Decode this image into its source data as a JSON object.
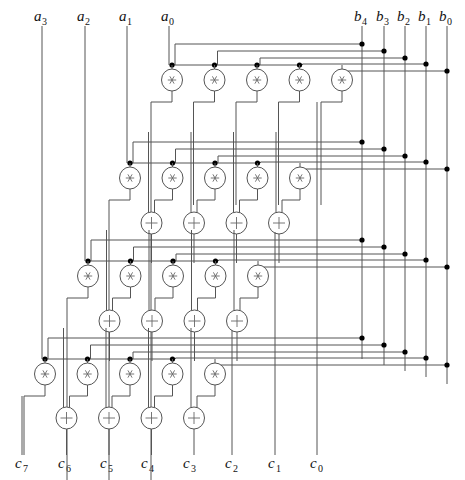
{
  "diagram": {
    "inputs_a": [
      {
        "name": "a",
        "sub": "3",
        "x": 42
      },
      {
        "name": "a",
        "sub": "2",
        "x": 85
      },
      {
        "name": "a",
        "sub": "1",
        "x": 127
      },
      {
        "name": "a",
        "sub": "0",
        "x": 169
      }
    ],
    "inputs_b": [
      {
        "name": "b",
        "sub": "4",
        "x": 362
      },
      {
        "name": "b",
        "sub": "3",
        "x": 384
      },
      {
        "name": "b",
        "sub": "2",
        "x": 405
      },
      {
        "name": "b",
        "sub": "1",
        "x": 426
      },
      {
        "name": "b",
        "sub": "0",
        "x": 447
      }
    ],
    "outputs_c": [
      {
        "name": "c",
        "sub": "7",
        "x": 22
      },
      {
        "name": "c",
        "sub": "6",
        "x": 65
      },
      {
        "name": "c",
        "sub": "5",
        "x": 107
      },
      {
        "name": "c",
        "sub": "4",
        "x": 148
      },
      {
        "name": "c",
        "sub": "3",
        "x": 190
      },
      {
        "name": "c",
        "sub": "2",
        "x": 232
      },
      {
        "name": "c",
        "sub": "1",
        "x": 275
      },
      {
        "name": "c",
        "sub": "0",
        "x": 317
      }
    ],
    "multiply_symbol": "*",
    "add_symbol": "+",
    "rows": [
      {
        "a_index": 0,
        "mult_y": 80,
        "dot_y": 65,
        "x0": 172,
        "has_adders": false
      },
      {
        "a_index": 1,
        "mult_y": 178,
        "dot_y": 163,
        "x0": 130,
        "has_adders": true,
        "add_y": 223
      },
      {
        "a_index": 2,
        "mult_y": 276,
        "dot_y": 261,
        "x0": 88,
        "has_adders": true,
        "add_y": 321
      },
      {
        "a_index": 3,
        "mult_y": 374,
        "dot_y": 359,
        "x0": 45,
        "has_adders": true,
        "add_y": 418
      }
    ],
    "column_spacing": 42.5,
    "multipliers_per_row": 5,
    "adders_per_row": 4
  }
}
